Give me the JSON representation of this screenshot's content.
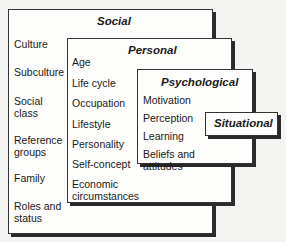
{
  "diagram": {
    "social": {
      "title": "Social",
      "items": [
        "Culture",
        "Subculture",
        "Social\nclass",
        "Reference\ngroups",
        "Family",
        "Roles and\nstatus"
      ]
    },
    "personal": {
      "title": "Personal",
      "items": [
        "Age",
        "Life cycle",
        "Occupation",
        "Lifestyle",
        "Personality",
        "Self-concept",
        "Economic\ncircumstances"
      ]
    },
    "psychological": {
      "title": "Psychological",
      "items": [
        "Motivation",
        "Perception",
        "Learning",
        "Beliefs and\nattitudes"
      ]
    },
    "situational": {
      "title": "Situational"
    }
  }
}
